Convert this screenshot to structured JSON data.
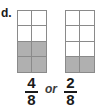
{
  "worksheet": {
    "item_letter": "d.",
    "conjunction": "or",
    "models": [
      {
        "name": "fraction-model-left",
        "columns": 2,
        "rows": 4,
        "total_parts": 8,
        "shaded_parts": 4,
        "shaded_cells": [
          4,
          5,
          6,
          7
        ],
        "shaded_color": "#b0b0b0",
        "line_color": "#8a8a8a"
      },
      {
        "name": "fraction-model-right",
        "columns": 2,
        "rows": 4,
        "total_parts": 8,
        "shaded_parts": 2,
        "shaded_cells": [
          6,
          7
        ],
        "shaded_color": "#b0b0b0",
        "line_color": "#8a8a8a"
      }
    ],
    "fractions": [
      {
        "name": "fraction-four-eighths",
        "numerator": "4",
        "denominator": "8"
      },
      {
        "name": "fraction-two-eighths",
        "numerator": "2",
        "denominator": "8"
      }
    ]
  }
}
